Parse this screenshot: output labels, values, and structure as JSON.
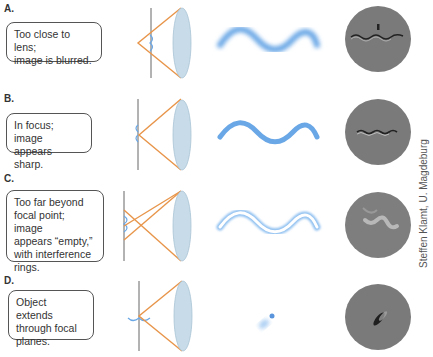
{
  "panels": [
    {
      "label": "A.",
      "caption_lines": [
        "Too close to lens;",
        "image is blurred."
      ],
      "state": "blurred"
    },
    {
      "label": "B.",
      "caption_lines": [
        "In focus; image",
        "appears sharp."
      ],
      "state": "sharp"
    },
    {
      "label": "C.",
      "caption_lines": [
        "Too far beyond",
        "focal point; image",
        "appears “empty,”",
        "with interference",
        "rings."
      ],
      "state": "empty"
    },
    {
      "label": "D.",
      "caption_lines": [
        "Object extends",
        "through focal",
        "planes."
      ],
      "state": "extended"
    }
  ],
  "credit": "Steffen Klamt, U. Magdeburg",
  "colors": {
    "ray": "#e8954a",
    "object": "#6aa7e6",
    "lens": "#c7dbe8",
    "micrograph": "#7a7a7a"
  }
}
